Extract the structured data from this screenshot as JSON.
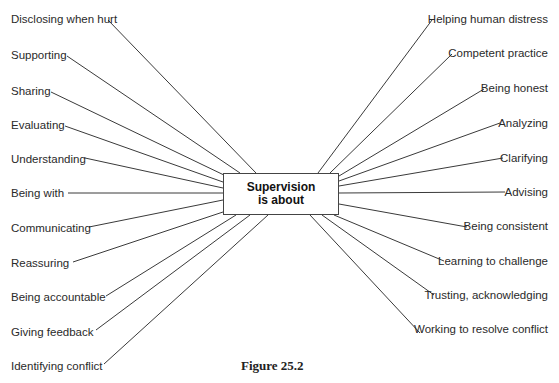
{
  "diagram": {
    "center": {
      "line1": "Supervision",
      "line2": "is about"
    },
    "left_items": [
      {
        "label": "Disclosing when hurt",
        "x": 11,
        "y": 12,
        "lx": 108,
        "ly": 20,
        "ex": 256,
        "ey": 173
      },
      {
        "label": "Supporting",
        "x": 11,
        "y": 48,
        "lx": 67,
        "ly": 56,
        "ex": 240,
        "ey": 173
      },
      {
        "label": "Sharing",
        "x": 11,
        "y": 84,
        "lx": 51,
        "ly": 92,
        "ex": 226,
        "ey": 176
      },
      {
        "label": "Evaluating",
        "x": 11,
        "y": 118,
        "lx": 65,
        "ly": 126,
        "ex": 223,
        "ey": 182
      },
      {
        "label": "Understanding",
        "x": 11,
        "y": 152,
        "lx": 85,
        "ly": 158,
        "ex": 223,
        "ey": 188
      },
      {
        "label": "Being with",
        "x": 11,
        "y": 186,
        "lx": 68,
        "ly": 193,
        "ex": 223,
        "ey": 193
      },
      {
        "label": "Communicating",
        "x": 11,
        "y": 221,
        "lx": 89,
        "ly": 227,
        "ex": 223,
        "ey": 200
      },
      {
        "label": "Reassuring",
        "x": 11,
        "y": 256,
        "lx": 73,
        "ly": 262,
        "ex": 223,
        "ey": 212
      },
      {
        "label": "Being accountable",
        "x": 11,
        "y": 290,
        "lx": 106,
        "ly": 296,
        "ex": 236,
        "ey": 215
      },
      {
        "label": "Giving feedback",
        "x": 11,
        "y": 325,
        "lx": 96,
        "ly": 330,
        "ex": 250,
        "ey": 215
      },
      {
        "label": "Identifying conflict",
        "x": 11,
        "y": 359,
        "lx": 104,
        "ly": 364,
        "ex": 268,
        "ey": 215
      }
    ],
    "right_items": [
      {
        "label": "Helping human distress",
        "x": 548,
        "y": 12,
        "lx": 432,
        "ly": 20,
        "ex": 318,
        "ey": 173
      },
      {
        "label": "Competent practice",
        "x": 548,
        "y": 46,
        "lx": 452,
        "ly": 54,
        "ex": 330,
        "ey": 173
      },
      {
        "label": "Being honest",
        "x": 548,
        "y": 81,
        "lx": 484,
        "ly": 89,
        "ex": 339,
        "ey": 176
      },
      {
        "label": "Analyzing",
        "x": 548,
        "y": 116,
        "lx": 500,
        "ly": 123,
        "ex": 339,
        "ey": 181
      },
      {
        "label": "Clarifying",
        "x": 548,
        "y": 151,
        "lx": 503,
        "ly": 158,
        "ex": 339,
        "ey": 186
      },
      {
        "label": "Advising",
        "x": 548,
        "y": 185,
        "lx": 505,
        "ly": 192,
        "ex": 339,
        "ey": 193
      },
      {
        "label": "Being consistent",
        "x": 548,
        "y": 219,
        "lx": 467,
        "ly": 227,
        "ex": 339,
        "ey": 204
      },
      {
        "label": "Learning to challenge",
        "x": 548,
        "y": 254,
        "lx": 444,
        "ly": 261,
        "ex": 334,
        "ey": 215
      },
      {
        "label": "Trusting, acknowledging",
        "x": 548,
        "y": 288,
        "lx": 434,
        "ly": 295,
        "ex": 322,
        "ey": 215
      },
      {
        "label": "Working to resolve conflict",
        "x": 548,
        "y": 322,
        "lx": 420,
        "ly": 333,
        "ex": 310,
        "ey": 215
      }
    ],
    "caption": "Figure 25.2",
    "colors": {
      "line": "#3a3a3a",
      "text": "#2a2a2a",
      "box_border": "#444444"
    }
  }
}
